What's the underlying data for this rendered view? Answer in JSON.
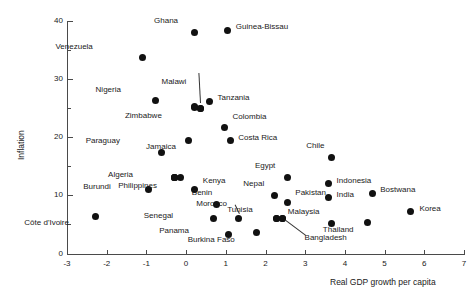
{
  "chart_data": {
    "type": "scatter",
    "title": "",
    "xlabel": "Real GDP growth per capita",
    "ylabel": "Inflation",
    "xlim": [
      -3,
      7
    ],
    "ylim": [
      0,
      40
    ],
    "xticks": [
      -3,
      -2,
      -1,
      0,
      1,
      2,
      3,
      4,
      5,
      6,
      7
    ],
    "xtick_labels": [
      "-3",
      "-2",
      "-1",
      "0",
      "1",
      "2",
      "3",
      "4",
      "5",
      "6",
      "7"
    ],
    "yticks": [
      0,
      10,
      20,
      30,
      40
    ],
    "ytick_labels": [
      "0",
      "10",
      "20",
      "30",
      "40"
    ],
    "yminorticks": [
      5,
      15,
      25,
      35
    ],
    "grid": false,
    "legend": false,
    "marker": "filled-circle",
    "marker_color": "#111111",
    "points": [
      {
        "label": "Ghana",
        "x": 0.2,
        "y": 38.0,
        "lx": -16,
        "ly": -13,
        "leader": false
      },
      {
        "label": "Guinea-Bissau",
        "x": 1.05,
        "y": 38.4,
        "lx": 8,
        "ly": -4,
        "leader": false
      },
      {
        "label": "Venezuela",
        "x": -1.09,
        "y": 33.7,
        "lx": -50,
        "ly": -12,
        "leader": false
      },
      {
        "label": "Nigeria",
        "x": -0.76,
        "y": 26.3,
        "lx": -35,
        "ly": -12,
        "leader": false
      },
      {
        "label": "Malawi",
        "x": 0.36,
        "y": 25.0,
        "lx": -14,
        "ly": -27,
        "leader": true
      },
      {
        "label": "Zimbabwe",
        "x": 0.22,
        "y": 25.2,
        "lx": -33,
        "ly": 8,
        "leader": false
      },
      {
        "label": "Tanzania",
        "x": 0.59,
        "y": 26.2,
        "lx": 8,
        "ly": -4,
        "leader": false
      },
      {
        "label": "Colombia",
        "x": 0.97,
        "y": 21.7,
        "lx": 8,
        "ly": -11,
        "leader": false
      },
      {
        "label": "Costa Rica",
        "x": 1.11,
        "y": 19.4,
        "lx": 8,
        "ly": -4,
        "leader": false
      },
      {
        "label": "Paraguay",
        "x": -0.61,
        "y": 17.4,
        "lx": -42,
        "ly": -12,
        "leader": false
      },
      {
        "label": "Jamaica",
        "x": 0.07,
        "y": 19.5,
        "lx": -13,
        "ly": 6,
        "leader": false
      },
      {
        "label": "Algeria",
        "x": -0.28,
        "y": 13.0,
        "lx": -42,
        "ly": -4,
        "leader": false
      },
      {
        "label": "Kenya",
        "x": 0.22,
        "y": 11.0,
        "lx": 8,
        "ly": -10,
        "leader": false
      },
      {
        "label": "Burundi",
        "x": -0.94,
        "y": 11.0,
        "lx": -38,
        "ly": -4,
        "leader": false
      },
      {
        "label": "Philippines",
        "x": -0.28,
        "y": 13.0,
        "lx": -18,
        "ly": 7,
        "leader": false
      },
      {
        "label": "Benin",
        "x": 0.76,
        "y": 8.5,
        "lx": -4,
        "ly": -12,
        "leader": false
      },
      {
        "label": "Morocco",
        "x": 1.33,
        "y": 6.0,
        "lx": -12,
        "ly": -16,
        "leader": true
      },
      {
        "label": "Nepal",
        "x": 2.22,
        "y": 10.0,
        "lx": -10,
        "ly": -12,
        "leader": false
      },
      {
        "label": "Pakistan",
        "x": 2.55,
        "y": 8.8,
        "lx": 8,
        "ly": -10,
        "leader": false
      },
      {
        "label": "Egypt",
        "x": 2.55,
        "y": 13.0,
        "lx": -12,
        "ly": -13,
        "leader": false
      },
      {
        "label": "Tunisia",
        "x": 2.28,
        "y": 6.0,
        "lx": -24,
        "ly": -10,
        "leader": false
      },
      {
        "label": "Bangladesh",
        "x": 2.43,
        "y": 6.0,
        "lx": 22,
        "ly": 18,
        "leader": true
      },
      {
        "label": "Senegal",
        "x": 0.68,
        "y": 6.0,
        "lx": -40,
        "ly": -4,
        "leader": false
      },
      {
        "label": "Panama",
        "x": 1.08,
        "y": 3.3,
        "lx": -40,
        "ly": -4,
        "leader": false
      },
      {
        "label": "Burkina Faso",
        "x": 1.78,
        "y": 3.6,
        "lx": -22,
        "ly": 6,
        "leader": false
      },
      {
        "label": "Malaysia",
        "x": 3.66,
        "y": 5.2,
        "lx": -12,
        "ly": -12,
        "leader": false
      },
      {
        "label": "Thailand",
        "x": 4.57,
        "y": 5.3,
        "lx": -14,
        "ly": 6,
        "leader": false
      },
      {
        "label": "India",
        "x": 3.59,
        "y": 9.6,
        "lx": 8,
        "ly": -4,
        "leader": false
      },
      {
        "label": "Indonesia",
        "x": 3.59,
        "y": 12.0,
        "lx": 8,
        "ly": -4,
        "leader": false
      },
      {
        "label": "Chile",
        "x": 3.66,
        "y": 16.5,
        "lx": -7,
        "ly": -13,
        "leader": false
      },
      {
        "label": "Bostwana",
        "x": 4.69,
        "y": 10.4,
        "lx": 8,
        "ly": -4,
        "leader": false
      },
      {
        "label": "Korea",
        "x": 5.65,
        "y": 7.2,
        "lx": 9,
        "ly": -4,
        "leader": false
      },
      {
        "label": "Côte d'Ivoire",
        "x": -2.27,
        "y": 6.4,
        "lx": -27,
        "ly": 6,
        "leader": false
      }
    ],
    "extra_points": [
      {
        "x": 0.36,
        "y": 25.0
      },
      {
        "x": 0.22,
        "y": 25.3
      },
      {
        "x": -0.28,
        "y": 13.0
      },
      {
        "x": -0.14,
        "y": 13.0
      },
      {
        "x": 2.28,
        "y": 6.0
      },
      {
        "x": 2.43,
        "y": 6.0
      }
    ]
  }
}
